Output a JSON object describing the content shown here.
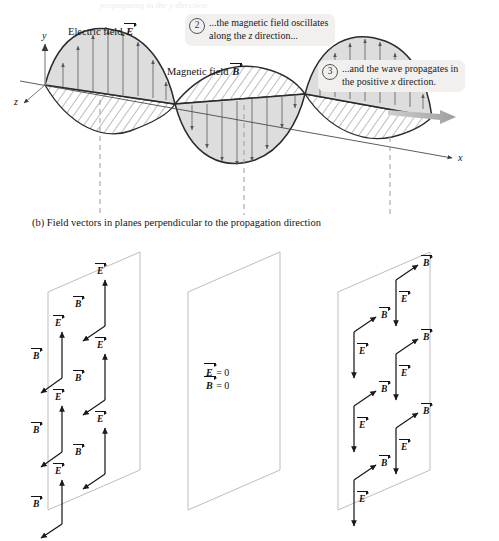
{
  "figure": {
    "cutoff_top_text": "propagating in the y direction",
    "part_b_caption": "(b) Field vectors in planes perpendicular to the propagation direction",
    "electric_field_label": "Electric field",
    "electric_field_symbol": "E",
    "magnetic_field_label": "Magnetic field",
    "magnetic_field_symbol": "B",
    "axes": {
      "x": "x",
      "y": "y",
      "z": "z"
    },
    "callouts": [
      {
        "number": "2",
        "line1_pre": "...the magnetic field oscillates",
        "line2_pre": "along the ",
        "line2_italic": "z",
        "line2_post": " direction..."
      },
      {
        "number": "3",
        "line1_pre": "...and the wave propagates in",
        "line2_pre": "the positive ",
        "line2_italic": "x",
        "line2_post": " direction."
      }
    ],
    "planes": {
      "left": {
        "name": "left-plane",
        "e_symbol": "E",
        "b_symbol": "B",
        "e_direction": "up",
        "b_direction": "down-left",
        "pair_count": 6
      },
      "middle": {
        "name": "middle-plane",
        "e_zero": "= 0",
        "b_zero": "= 0",
        "e_symbol": "E",
        "b_symbol": "B"
      },
      "right": {
        "name": "right-plane",
        "e_symbol": "E",
        "b_symbol": "B",
        "e_direction": "down",
        "b_direction": "up-right",
        "pair_count": 6
      }
    },
    "colors": {
      "wave_stroke": "#2b2b2b",
      "e_fill": "#d9d9d9",
      "b_fill": "#ffffff",
      "hatch": "#4a4a4a",
      "arrow_gray": "#a8a8a8",
      "plane_stroke": "#b8b8b8",
      "dashed_guide": "#9a9a9a",
      "callout_bg": "#f2f0ee"
    }
  }
}
